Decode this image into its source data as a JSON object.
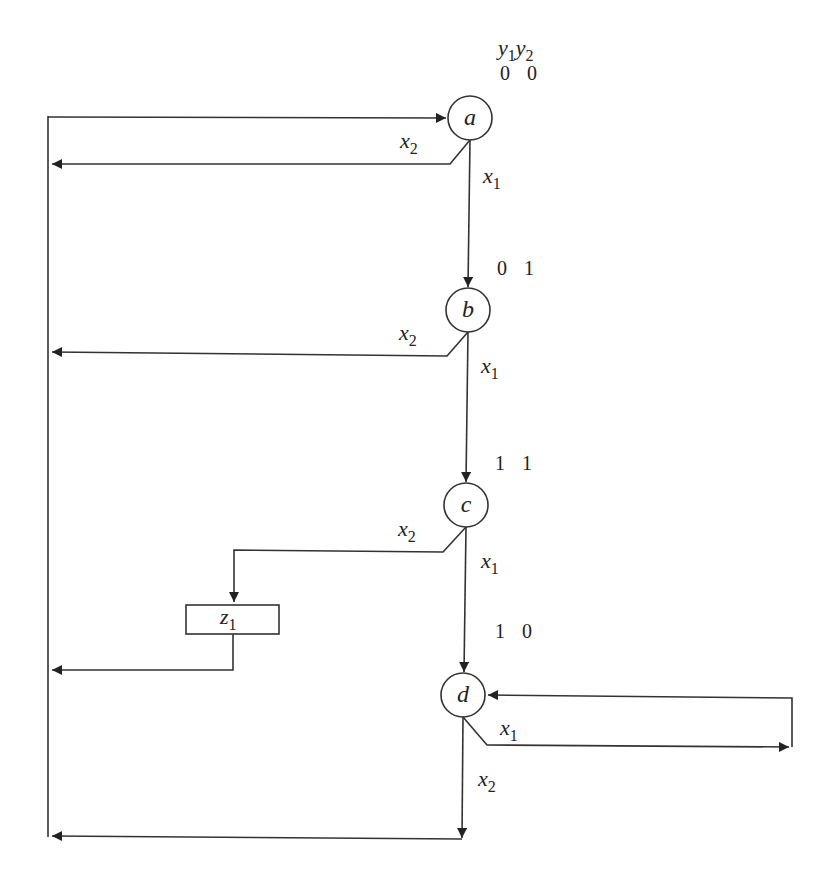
{
  "diagram": {
    "type": "ASM chart / state diagram",
    "header_labels": {
      "y1": "y",
      "y1_sub": "1",
      "y2": "y",
      "y2_sub": "2"
    },
    "states": [
      {
        "id": "a",
        "label": "a",
        "code": "0 0"
      },
      {
        "id": "b",
        "label": "b",
        "code": "0 1"
      },
      {
        "id": "c",
        "label": "c",
        "code": "1 1"
      },
      {
        "id": "d",
        "label": "d",
        "code": "1 0"
      }
    ],
    "output_box": {
      "label": "z",
      "sub": "1"
    },
    "transitions": [
      {
        "from": "a",
        "to": "b",
        "cond": "x",
        "sub": "1"
      },
      {
        "from": "a",
        "to": "a",
        "cond": "x",
        "sub": "2"
      },
      {
        "from": "b",
        "to": "c",
        "cond": "x",
        "sub": "1"
      },
      {
        "from": "b",
        "to": "a",
        "cond": "x",
        "sub": "2"
      },
      {
        "from": "c",
        "to": "d",
        "cond": "x",
        "sub": "1"
      },
      {
        "from": "c",
        "to": "z1-then-a",
        "cond": "x",
        "sub": "2"
      },
      {
        "from": "d",
        "to": "d",
        "cond": "x",
        "sub": "1"
      },
      {
        "from": "d",
        "to": "a",
        "cond": "x",
        "sub": "2"
      }
    ],
    "colors": {
      "line": "#333333",
      "background": "#ffffff"
    }
  }
}
